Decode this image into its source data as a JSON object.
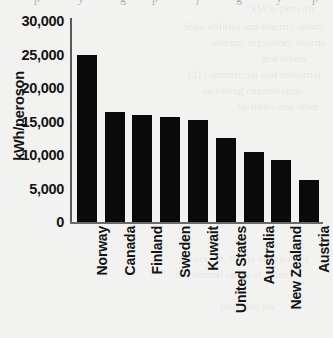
{
  "chart_data": {
    "type": "bar",
    "title": "",
    "xlabel": "",
    "ylabel": "kWh/peroson",
    "categories": [
      "Norway",
      "Canada",
      "Finland",
      "Sweden",
      "Kuwait",
      "United States",
      "Australia",
      "New Zealand",
      "Austria"
    ],
    "values": [
      25000,
      16400,
      16000,
      15600,
      15200,
      12600,
      10500,
      9300,
      6200
    ],
    "ylim": [
      0,
      30000
    ],
    "ytick_labels": [
      "30,000",
      "25,000",
      "20,000",
      "15,000",
      "10,000",
      "5,000",
      "0"
    ],
    "ytick_values": [
      30000,
      25000,
      20000,
      15000,
      10000,
      5000,
      0
    ],
    "grid": false,
    "legend": false,
    "bar_color": "#0a0a0a",
    "background_color": "#f2f2f0",
    "axis_color": "#5a5a5a"
  },
  "artifacts": {
    "bleed_text": [
      "kWh/person",
      "State utilities and electric utility",
      "electric regulatory boards",
      "and others",
      "(2) Commercial and industrial",
      "including cogeneration",
      "facilities and other",
      "Of course, this is only part of",
      "the normal range of values",
      "provided for"
    ],
    "cut_descenders": [
      "p",
      "y",
      "g",
      "p",
      "j",
      "g",
      "y",
      "p"
    ]
  }
}
